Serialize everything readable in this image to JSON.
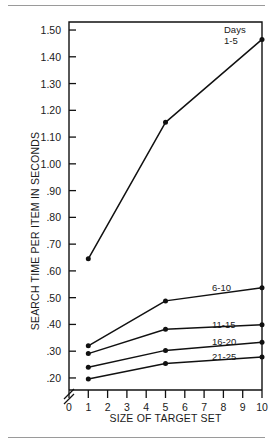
{
  "chart_data": {
    "type": "line",
    "title": "",
    "xlabel": "SIZE OF TARGET SET",
    "ylabel": "SEARCH TIME PER ITEM IN SECONDS",
    "legend_title": "Days",
    "legend_position": "right-inline",
    "grid": false,
    "axis_break_y": true,
    "xlim": [
      0,
      10
    ],
    "ylim": [
      0.155,
      1.53
    ],
    "x": [
      1,
      5,
      10
    ],
    "xticks": [
      "0",
      "1",
      "2",
      "3",
      "4",
      "5",
      "6",
      "7",
      "8",
      "9",
      "10"
    ],
    "xtick_values": [
      0,
      1,
      2,
      3,
      4,
      5,
      6,
      7,
      8,
      9,
      10
    ],
    "yticks": [
      "1.50",
      "1.40",
      "1.30",
      "1.20",
      "1.10",
      "1.00",
      ".90",
      ".80",
      ".70",
      ".60",
      ".50",
      ".40",
      ".30",
      ".20"
    ],
    "ytick_values": [
      1.5,
      1.4,
      1.3,
      1.2,
      1.1,
      1.0,
      0.9,
      0.8,
      0.7,
      0.6,
      0.5,
      0.4,
      0.3,
      0.2
    ],
    "series": [
      {
        "name": "1-5",
        "label": "1-5",
        "values": [
          0.645,
          1.155,
          1.465
        ]
      },
      {
        "name": "6-10",
        "label": "6-10",
        "values": [
          0.32,
          0.488,
          0.537
        ]
      },
      {
        "name": "11-15",
        "label": "11-15",
        "values": [
          0.291,
          0.382,
          0.399
        ]
      },
      {
        "name": "16-20",
        "label": "16-20",
        "values": [
          0.24,
          0.303,
          0.333
        ]
      },
      {
        "name": "21-25",
        "label": "21-25",
        "values": [
          0.196,
          0.254,
          0.278
        ]
      }
    ],
    "colors": {
      "line": "#111111",
      "marker": "#111111",
      "axis": "#111111",
      "text": "#1a1a1a",
      "rule": "#9a9a9a"
    }
  }
}
